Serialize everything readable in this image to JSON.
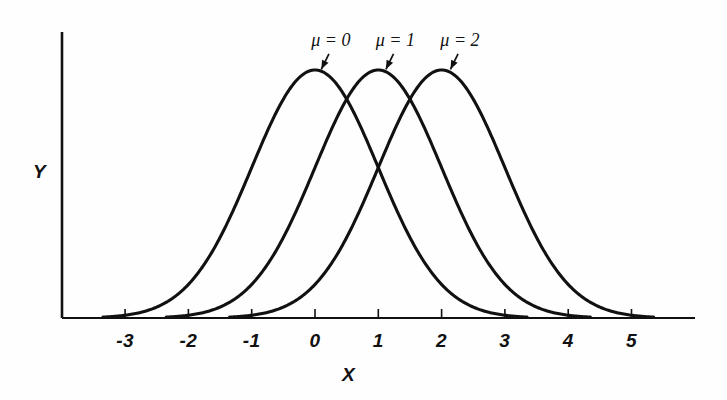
{
  "figure": {
    "background_color": "#fefefe",
    "ink_color": "#111111"
  },
  "chart_data": {
    "type": "line",
    "title": "",
    "subtitle": "",
    "xlabel": "X",
    "ylabel": "Y",
    "grid": false,
    "legend_position": "inline-annotations",
    "xlim": [
      -3.8,
      6.0
    ],
    "ylim": [
      0,
      0.44
    ],
    "xticks": [
      -3,
      -2,
      -1,
      0,
      1,
      2,
      3,
      4,
      5
    ],
    "xticklabels": [
      "-3",
      "-2",
      "-1",
      "0",
      "1",
      "2",
      "3",
      "4",
      "5"
    ],
    "yticks": [],
    "yticklabels": [],
    "series": [
      {
        "name": "mu = 0",
        "annotation": "μ = 0",
        "mean": 0,
        "sigma": 1,
        "peak_x": 0,
        "peak_y": 0.3989,
        "annotation_x": 0.25,
        "annotation_y": 0.44,
        "pointer_from_x": 0.22,
        "pointer_from_y": 0.425,
        "pointer_to_x": 0.1,
        "pointer_to_y": 0.4
      },
      {
        "name": "mu = 1",
        "annotation": "μ = 1",
        "mean": 1,
        "sigma": 1,
        "peak_x": 1,
        "peak_y": 0.3989,
        "annotation_x": 1.27,
        "annotation_y": 0.44,
        "pointer_from_x": 1.24,
        "pointer_from_y": 0.425,
        "pointer_to_x": 1.12,
        "pointer_to_y": 0.4
      },
      {
        "name": "mu = 2",
        "annotation": "μ = 2",
        "mean": 2,
        "sigma": 1,
        "peak_x": 2,
        "peak_y": 0.3989,
        "annotation_x": 2.29,
        "annotation_y": 0.44,
        "pointer_from_x": 2.26,
        "pointer_from_y": 0.425,
        "pointer_to_x": 2.14,
        "pointer_to_y": 0.4
      }
    ]
  }
}
